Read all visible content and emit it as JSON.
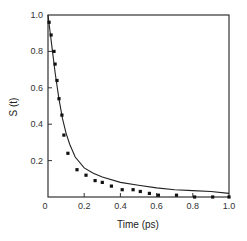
{
  "chart_data": {
    "type": "scatter",
    "title": "",
    "xlabel": "Time (ps)",
    "ylabel": "S (t)",
    "xlim": [
      0,
      1.0
    ],
    "ylim": [
      0,
      1.0
    ],
    "grid": false,
    "legend": null,
    "x_ticks": [
      "0",
      "0.2",
      "0.4",
      "0.6",
      "0.8",
      "1.0"
    ],
    "y_ticks": [
      "0.2",
      "0.4",
      "0.6",
      "0.8",
      "1.0"
    ],
    "series": [
      {
        "name": "data points",
        "style": "dots",
        "x": [
          0.006,
          0.017,
          0.033,
          0.039,
          0.05,
          0.061,
          0.077,
          0.088,
          0.11,
          0.16,
          0.21,
          0.26,
          0.3,
          0.35,
          0.41,
          0.47,
          0.51,
          0.56,
          0.61,
          0.71,
          0.81,
          0.91,
          1.0
        ],
        "values": [
          0.96,
          0.89,
          0.8,
          0.73,
          0.64,
          0.54,
          0.45,
          0.34,
          0.24,
          0.15,
          0.12,
          0.09,
          0.08,
          0.06,
          0.04,
          0.04,
          0.03,
          0.02,
          0.01,
          0.01,
          0.0,
          0.0,
          0.0
        ]
      },
      {
        "name": "fit curve",
        "style": "line",
        "x": [
          0.0,
          0.02,
          0.04,
          0.06,
          0.08,
          0.1,
          0.12,
          0.15,
          0.2,
          0.25,
          0.3,
          0.4,
          0.5,
          0.6,
          0.7,
          0.8,
          0.9,
          1.0
        ],
        "values": [
          1.0,
          0.84,
          0.68,
          0.54,
          0.43,
          0.35,
          0.29,
          0.22,
          0.16,
          0.13,
          0.11,
          0.08,
          0.065,
          0.05,
          0.04,
          0.035,
          0.03,
          0.02
        ]
      }
    ]
  },
  "colors": {
    "axis": "#333333",
    "dots": "#111111",
    "curve": "#222222"
  }
}
